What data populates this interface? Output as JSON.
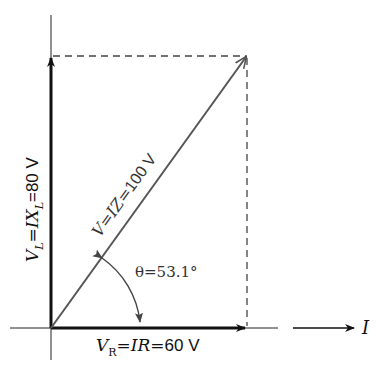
{
  "diagram": {
    "type": "phasor-diagram",
    "labels": {
      "vl_prefix": "V",
      "vl_sub": "L",
      "vl_mid": "=IX",
      "vl_sub2": "L",
      "vl_value": "=80 V",
      "v_prefix": "V=IZ=",
      "v_value": "100 V",
      "theta": "θ=53.1°",
      "vr_prefix": "V",
      "vr_sub": "R",
      "vr_mid": "=IR=",
      "vr_value": "60 V",
      "current": "I"
    },
    "phasors": [
      {
        "name": "V_L",
        "magnitude": "80 V",
        "direction": "vertical"
      },
      {
        "name": "V",
        "magnitude": "100 V",
        "angle": "53.1°"
      },
      {
        "name": "V_R",
        "magnitude": "60 V",
        "direction": "horizontal"
      }
    ],
    "colors": {
      "axis": "#111111",
      "resultant": "#555555",
      "dashed": "#444444"
    }
  }
}
